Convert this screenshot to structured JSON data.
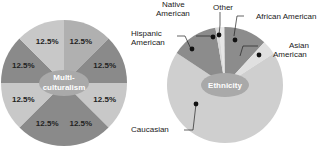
{
  "chart_data": [
    {
      "type": "pie",
      "title": "Multiculturalism",
      "center_label_lines": [
        "Multi-",
        "culturalism"
      ],
      "slices": [
        {
          "label": "12.5%",
          "value": 12.5,
          "color": "#b0b0b0"
        },
        {
          "label": "12.5%",
          "value": 12.5,
          "color": "#8a8a8a"
        },
        {
          "label": "12.5%",
          "value": 12.5,
          "color": "#c8c8c8"
        },
        {
          "label": "12.5%",
          "value": 12.5,
          "color": "#8a8a8a"
        },
        {
          "label": "12.5%",
          "value": 12.5,
          "color": "#8a8a8a"
        },
        {
          "label": "12.5%",
          "value": 12.5,
          "color": "#c8c8c8"
        },
        {
          "label": "12.5%",
          "value": 12.5,
          "color": "#8a8a8a"
        },
        {
          "label": "12.5%",
          "value": 12.5,
          "color": "#c8c8c8"
        }
      ]
    },
    {
      "type": "pie",
      "title": "Ethnicity",
      "center_label": "Ethnicity",
      "slices": [
        {
          "label": "Other",
          "value": 1.5,
          "color": "#e6e6e6"
        },
        {
          "label": "African American",
          "value": 12,
          "color": "#8c8c8c"
        },
        {
          "label": "Asian American",
          "value": 4,
          "color": "#e0e0e0"
        },
        {
          "label": "Caucasian",
          "value": 68.5,
          "color": "#cfcfcf"
        },
        {
          "label": "Hispanic American",
          "value": 13,
          "color": "#8c8c8c"
        },
        {
          "label": "Native American",
          "value": 1,
          "color": "#d8d8d8"
        }
      ],
      "callouts": [
        {
          "lines": [
            "Native",
            "American"
          ]
        },
        {
          "lines": [
            "Other"
          ]
        },
        {
          "lines": [
            "African American"
          ]
        },
        {
          "lines": [
            "Hispanic",
            "American"
          ]
        },
        {
          "lines": [
            "Asian",
            "American"
          ]
        },
        {
          "lines": [
            "Caucasian"
          ]
        }
      ]
    }
  ]
}
